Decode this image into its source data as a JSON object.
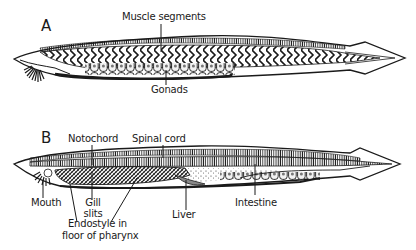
{
  "figure": {
    "panels": [
      {
        "id": "A",
        "letter": "A",
        "labels": {
          "muscle_segments": "Muscle segments",
          "gonads": "Gonads"
        }
      },
      {
        "id": "B",
        "letter": "B",
        "labels": {
          "notochord": "Notochord",
          "spinal_cord": "Spinal cord",
          "mouth": "Mouth",
          "gill_slits_line1": "Gill",
          "gill_slits_line2": "slits",
          "endostyle_line1": "Endostyle in",
          "endostyle_line2": "floor of pharynx",
          "liver": "Liver",
          "intestine": "Intestine"
        }
      }
    ],
    "colors": {
      "ink": "#1a1a1a",
      "paper": "#ffffff",
      "shade": "#555555"
    }
  }
}
